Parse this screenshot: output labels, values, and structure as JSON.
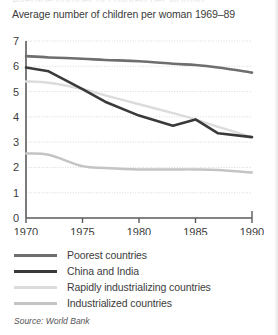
{
  "figure": {
    "title": "Average number of children per woman 1969–89",
    "source_note": "Source: World Bank",
    "top_clipped_text": "Average number of children per woman"
  },
  "colors": {
    "poorest": "#6e6e6e",
    "china_india": "#3a3a3a",
    "rapidly_industrializing": "#dcdcdc",
    "industrialized": "#c4c4c4",
    "axis": "#5a5a5a",
    "gridline": "#cfcfcf",
    "text": "#3c3c3c",
    "background": "#ffffff"
  },
  "legend": {
    "items": [
      {
        "label": "Poorest countries",
        "color": "#6e6e6e"
      },
      {
        "label": "China and India",
        "color": "#3a3a3a"
      },
      {
        "label": "Rapidly industrializing countries",
        "color": "#dcdcdc"
      },
      {
        "label": "Industrialized countries",
        "color": "#c4c4c4"
      }
    ]
  },
  "chart_data": {
    "type": "line",
    "title": "Average number of children per woman 1969–89",
    "xlabel": "",
    "ylabel": "",
    "xlim": [
      1970,
      1990
    ],
    "ylim": [
      0,
      7
    ],
    "xticks": [
      1970,
      1975,
      1980,
      1985,
      1990
    ],
    "yticks": [
      0,
      1,
      2,
      3,
      4,
      5,
      6,
      7
    ],
    "xtick_labels": [
      "1970",
      "1975",
      "1980",
      "1985",
      "1990"
    ],
    "ytick_labels": [
      "0",
      "1",
      "2",
      "3",
      "4",
      "5",
      "6",
      "7"
    ],
    "grid": true,
    "grid_style": "dotted-horizontal",
    "legend_position": "below",
    "source": "World Bank",
    "x": [
      1970,
      1972,
      1975,
      1977,
      1980,
      1983,
      1985,
      1987,
      1990
    ],
    "series": [
      {
        "name": "Poorest countries",
        "color": "#6e6e6e",
        "values": [
          6.4,
          6.35,
          6.3,
          6.25,
          6.2,
          6.1,
          6.05,
          5.95,
          5.75
        ]
      },
      {
        "name": "China and India",
        "color": "#3a3a3a",
        "values": [
          5.95,
          5.8,
          5.1,
          4.6,
          4.05,
          3.65,
          3.9,
          3.35,
          3.2
        ]
      },
      {
        "name": "Rapidly industrializing countries",
        "color": "#dcdcdc",
        "values": [
          5.4,
          5.35,
          5.1,
          4.85,
          4.5,
          4.15,
          3.9,
          3.6,
          3.2
        ]
      },
      {
        "name": "Industrialized countries",
        "color": "#c4c4c4",
        "values": [
          2.55,
          2.5,
          2.05,
          1.98,
          1.92,
          1.92,
          1.92,
          1.9,
          1.8
        ]
      }
    ]
  }
}
